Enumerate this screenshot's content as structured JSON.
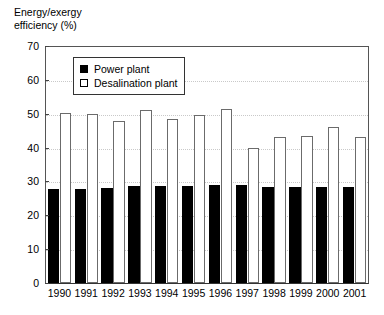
{
  "chart_data": {
    "type": "bar",
    "title": "Energy/exergy\nefficiency (%)",
    "xlabel": "",
    "ylabel": "Energy/exergy efficiency (%)",
    "ylim": [
      0,
      70
    ],
    "ytick_step": 10,
    "yticks": [
      0,
      10,
      20,
      30,
      40,
      50,
      60,
      70
    ],
    "ytick_labels": [
      "0",
      "10",
      "20",
      "30",
      "40",
      "50",
      "60",
      "70"
    ],
    "grid": true,
    "grid_axis": "y",
    "legend_position": "upper-left-inside",
    "categories": [
      "1990",
      "1991",
      "1992",
      "1993",
      "1994",
      "1995",
      "1996",
      "1997",
      "1998",
      "1999",
      "2000",
      "2001"
    ],
    "series": [
      {
        "name": "Power plant",
        "color": "#000000",
        "fill": "solid",
        "values": [
          27.8,
          27.8,
          28.2,
          28.8,
          28.8,
          28.8,
          29.0,
          29.0,
          28.5,
          28.5,
          28.5,
          28.5
        ]
      },
      {
        "name": "Desalination plant",
        "color": "#ffffff",
        "fill": "open",
        "values": [
          50.3,
          49.9,
          48.0,
          51.0,
          48.5,
          49.5,
          51.3,
          39.8,
          43.2,
          43.4,
          46.2,
          43.2
        ]
      }
    ]
  },
  "legend": {
    "items": [
      {
        "label": "Power plant",
        "swatch": "filled-square-icon"
      },
      {
        "label": "Desalination plant",
        "swatch": "open-square-icon"
      }
    ]
  }
}
